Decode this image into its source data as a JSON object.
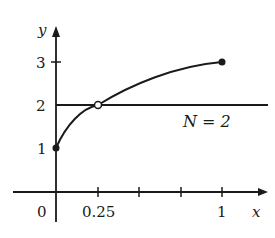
{
  "diagram": {
    "axes": {
      "x_label": "x",
      "y_label": "y",
      "origin_label": "0",
      "x_ticks": [
        {
          "value": 0.25,
          "label": "0.25"
        },
        {
          "value": 0.5,
          "label": ""
        },
        {
          "value": 0.75,
          "label": ""
        },
        {
          "value": 1,
          "label": "1"
        }
      ],
      "y_ticks": [
        {
          "value": 1,
          "label": "1"
        },
        {
          "value": 2,
          "label": "2"
        },
        {
          "value": 3,
          "label": "3"
        }
      ]
    },
    "horizontal_line": {
      "y": 2,
      "label": "N = 2"
    },
    "curve": {
      "from": [
        0,
        1
      ],
      "to": [
        1,
        3
      ],
      "shape": "concave increasing"
    },
    "points": [
      {
        "x": 0,
        "y": 1,
        "style": "filled"
      },
      {
        "x": 0.25,
        "y": 2,
        "style": "open"
      },
      {
        "x": 1,
        "y": 3,
        "style": "filled"
      }
    ],
    "colors": {
      "ink": "#1a1a1a",
      "background": "#ffffff"
    }
  }
}
